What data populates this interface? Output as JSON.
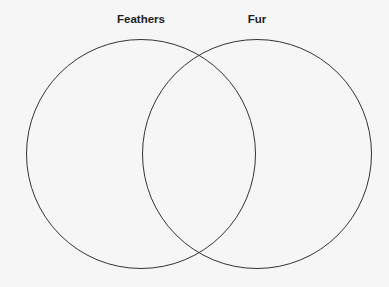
{
  "diagram": {
    "type": "venn",
    "sets": [
      {
        "label": "Feathers",
        "cx": 141,
        "cy": 154,
        "r": 115
      },
      {
        "label": "Fur",
        "cx": 257,
        "cy": 154,
        "r": 115
      }
    ],
    "stroke_color": "#333333",
    "background": "#f6f6f6"
  }
}
